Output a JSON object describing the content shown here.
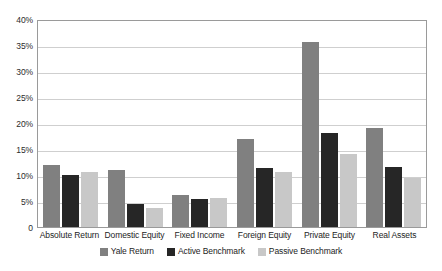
{
  "chart_data": {
    "type": "bar",
    "title": "",
    "xlabel": "",
    "ylabel": "",
    "ylim": [
      0,
      40
    ],
    "ytick_step": 5,
    "ytick_labels": [
      "40%",
      "35%",
      "30%",
      "25%",
      "20%",
      "15%",
      "10%",
      "5%",
      "0"
    ],
    "ytick_values": [
      40,
      35,
      30,
      25,
      20,
      15,
      10,
      5,
      0
    ],
    "grid": true,
    "grid_axis": "y",
    "legend_position": "bottom-center",
    "categories": [
      "Absolute Return",
      "Domestic Equity",
      "Fixed Income",
      "Foreign Equity",
      "Private Equity",
      "Real Assets"
    ],
    "series": [
      {
        "name": "Yale Return",
        "color": "#808080",
        "values": [
          12.0,
          11.0,
          6.2,
          17.0,
          35.5,
          19.0
        ]
      },
      {
        "name": "Active Benchmark",
        "color": "#262626",
        "values": [
          10.0,
          4.4,
          5.3,
          11.3,
          18.0,
          11.5
        ]
      },
      {
        "name": "Passive Benchmark",
        "color": "#c8c8c8",
        "values": [
          10.5,
          3.6,
          5.5,
          10.6,
          14.0,
          9.5
        ]
      }
    ]
  },
  "colors": {
    "yale_return": "#808080",
    "active_benchmark": "#262626",
    "passive_benchmark": "#c8c8c8",
    "gridline": "#cfcfcf",
    "axis_frame": "#9a9a9a",
    "text": "#1d1d1d",
    "background": "#ffffff"
  }
}
